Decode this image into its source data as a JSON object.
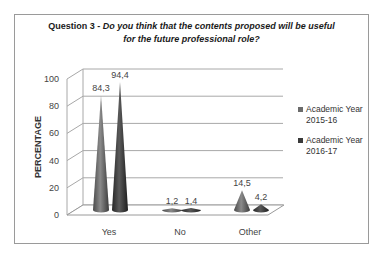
{
  "chart_data": {
    "type": "bar",
    "subtype": "3d-cone",
    "title": "Question 3 - Do you think that the contents proposed will be useful for the future professional role?",
    "title_prefix": "Question 3 - ",
    "title_question_line1": "Do you think that the contents proposed will be useful",
    "title_question_line2": "for the future professional role?",
    "xlabel": "",
    "ylabel": "PERCENTAGE",
    "ylim": [
      0,
      100
    ],
    "yticks": [
      "0",
      "20",
      "40",
      "60",
      "80",
      "100"
    ],
    "grid": true,
    "legend_position": "right",
    "categories": [
      "Yes",
      "No",
      "Other"
    ],
    "series": [
      {
        "name": "Academic Year 2015-16",
        "legend_line1": "Academic Year",
        "legend_line2": "2015-16",
        "color": "#6b6b6b",
        "values": [
          84.3,
          1.2,
          14.5
        ],
        "labels": [
          "84,3",
          "1,2",
          "14,5"
        ]
      },
      {
        "name": "Academic Year 2016-17",
        "legend_line1": "Academic Year",
        "legend_line2": "2016-17",
        "color": "#3a3a3a",
        "values": [
          94.4,
          1.4,
          4.2
        ],
        "labels": [
          "94,4",
          "1,4",
          "4,2"
        ]
      }
    ]
  }
}
